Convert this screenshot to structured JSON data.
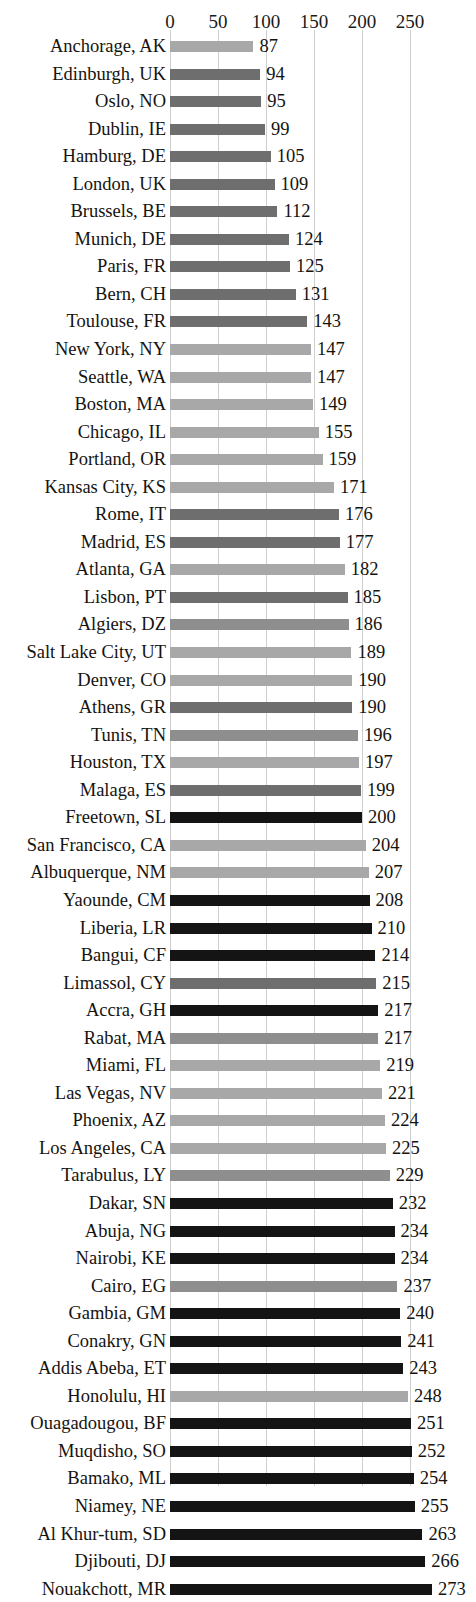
{
  "chart_data": {
    "type": "bar",
    "orientation": "horizontal",
    "title": "",
    "xlabel": "",
    "ylabel": "",
    "xlim": [
      0,
      273
    ],
    "axis_ticks": [
      0,
      50,
      100,
      150,
      200,
      250
    ],
    "axis_tick_labels": [
      "0",
      "50",
      "100",
      "150",
      "200",
      "250"
    ],
    "grid": true,
    "legend": "none",
    "value_labels_shown": true,
    "sort_order": "ascending",
    "colors": {
      "us": "#a8a8a8",
      "eu": "#6e6e6e",
      "africa": "#141414",
      "medgray": "#8e8e8e"
    },
    "categories": [
      "Anchorage, AK",
      "Edinburgh, UK",
      "Oslo, NO",
      "Dublin, IE",
      "Hamburg, DE",
      "London, UK",
      "Brussels, BE",
      "Munich, DE",
      "Paris, FR",
      "Bern, CH",
      "Toulouse, FR",
      "New York, NY",
      "Seattle, WA",
      "Boston, MA",
      "Chicago, IL",
      "Portland, OR",
      "Kansas City, KS",
      "Rome, IT",
      "Madrid, ES",
      "Atlanta, GA",
      "Lisbon, PT",
      "Algiers, DZ",
      "Salt Lake City, UT",
      "Denver, CO",
      "Athens, GR",
      "Tunis, TN",
      "Houston, TX",
      "Malaga, ES",
      "Freetown, SL",
      "San Francisco, CA",
      "Albuquerque, NM",
      "Yaounde, CM",
      "Liberia, LR",
      "Bangui, CF",
      "Limassol, CY",
      "Accra, GH",
      "Rabat, MA",
      "Miami, FL",
      "Las Vegas, NV",
      "Phoenix, AZ",
      "Los Angeles, CA",
      "Tarabulus, LY",
      "Dakar, SN",
      "Abuja, NG",
      "Nairobi, KE",
      "Cairo, EG",
      "Gambia, GM",
      "Conakry, GN",
      "Addis Abeba, ET",
      "Honolulu, HI",
      "Ouagadougou, BF",
      "Muqdisho, SO",
      "Bamako, ML",
      "Niamey, NE",
      "Al Khur-tum, SD",
      "Djibouti, DJ",
      "Nouakchott, MR"
    ],
    "values": [
      87,
      94,
      95,
      99,
      105,
      109,
      112,
      124,
      125,
      131,
      143,
      147,
      147,
      149,
      155,
      159,
      171,
      176,
      177,
      182,
      185,
      186,
      189,
      190,
      190,
      196,
      197,
      199,
      200,
      204,
      207,
      208,
      210,
      214,
      215,
      217,
      217,
      219,
      221,
      224,
      225,
      229,
      232,
      234,
      234,
      237,
      240,
      241,
      243,
      248,
      251,
      252,
      254,
      255,
      263,
      266,
      273
    ],
    "groups": [
      "us",
      "eu",
      "eu",
      "eu",
      "eu",
      "eu",
      "eu",
      "eu",
      "eu",
      "eu",
      "eu",
      "us",
      "us",
      "us",
      "us",
      "us",
      "us",
      "eu",
      "eu",
      "us",
      "eu",
      "medgray",
      "us",
      "us",
      "eu",
      "medgray",
      "us",
      "eu",
      "africa",
      "us",
      "us",
      "africa",
      "africa",
      "africa",
      "eu",
      "africa",
      "medgray",
      "us",
      "us",
      "us",
      "us",
      "medgray",
      "africa",
      "africa",
      "africa",
      "medgray",
      "africa",
      "africa",
      "africa",
      "us",
      "africa",
      "africa",
      "africa",
      "africa",
      "africa",
      "africa",
      "africa"
    ]
  }
}
